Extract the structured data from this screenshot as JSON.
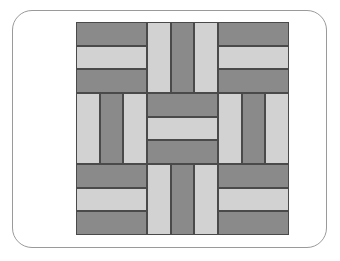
{
  "figure": {
    "background_color": "#ffffff"
  },
  "frame": {
    "name": "rounded-rectangle-border",
    "stroke_color": "#9a9a9a",
    "stroke_width": 1,
    "corner_radius": 20,
    "x": 12,
    "y": 10,
    "width": 315,
    "height": 238
  },
  "palette": {
    "dark_plank": "#8a8a8a",
    "light_plank": "#d2d2d2",
    "plank_outline": "#4a4a4a",
    "canvas": "#ffffff"
  },
  "pattern": {
    "name": "basket-weave",
    "x": 76,
    "y": 22,
    "width": 213,
    "height": 213,
    "grid_rows": 3,
    "grid_cols": 3,
    "block_size": 71,
    "planks_per_block": 3,
    "plank_thickness": 23.67,
    "blocks": [
      {
        "id": "block-r1-c1",
        "row": 1,
        "col": 1,
        "orientation": "horizontal",
        "x": 0,
        "y": 0,
        "size": 71,
        "planks": [
          {
            "index": 1,
            "color": "dark_plank",
            "fill": "#8a8a8a"
          },
          {
            "index": 2,
            "color": "light_plank",
            "fill": "#d2d2d2"
          },
          {
            "index": 3,
            "color": "dark_plank",
            "fill": "#8a8a8a"
          }
        ]
      },
      {
        "id": "block-r1-c2",
        "row": 1,
        "col": 2,
        "orientation": "vertical",
        "x": 71,
        "y": 0,
        "size": 71,
        "planks": [
          {
            "index": 1,
            "color": "light_plank",
            "fill": "#d2d2d2"
          },
          {
            "index": 2,
            "color": "dark_plank",
            "fill": "#8a8a8a"
          },
          {
            "index": 3,
            "color": "light_plank",
            "fill": "#d2d2d2"
          }
        ]
      },
      {
        "id": "block-r1-c3",
        "row": 1,
        "col": 3,
        "orientation": "horizontal",
        "x": 142,
        "y": 0,
        "size": 71,
        "planks": [
          {
            "index": 1,
            "color": "dark_plank",
            "fill": "#8a8a8a"
          },
          {
            "index": 2,
            "color": "light_plank",
            "fill": "#d2d2d2"
          },
          {
            "index": 3,
            "color": "dark_plank",
            "fill": "#8a8a8a"
          }
        ]
      },
      {
        "id": "block-r2-c1",
        "row": 2,
        "col": 1,
        "orientation": "vertical",
        "x": 0,
        "y": 71,
        "size": 71,
        "planks": [
          {
            "index": 1,
            "color": "light_plank",
            "fill": "#d2d2d2"
          },
          {
            "index": 2,
            "color": "dark_plank",
            "fill": "#8a8a8a"
          },
          {
            "index": 3,
            "color": "light_plank",
            "fill": "#d2d2d2"
          }
        ]
      },
      {
        "id": "block-r2-c2",
        "row": 2,
        "col": 2,
        "orientation": "horizontal",
        "x": 71,
        "y": 71,
        "size": 71,
        "planks": [
          {
            "index": 1,
            "color": "dark_plank",
            "fill": "#8a8a8a"
          },
          {
            "index": 2,
            "color": "light_plank",
            "fill": "#d2d2d2"
          },
          {
            "index": 3,
            "color": "dark_plank",
            "fill": "#8a8a8a"
          }
        ]
      },
      {
        "id": "block-r2-c3",
        "row": 2,
        "col": 3,
        "orientation": "vertical",
        "x": 142,
        "y": 71,
        "size": 71,
        "planks": [
          {
            "index": 1,
            "color": "light_plank",
            "fill": "#d2d2d2"
          },
          {
            "index": 2,
            "color": "dark_plank",
            "fill": "#8a8a8a"
          },
          {
            "index": 3,
            "color": "light_plank",
            "fill": "#d2d2d2"
          }
        ]
      },
      {
        "id": "block-r3-c1",
        "row": 3,
        "col": 1,
        "orientation": "horizontal",
        "x": 0,
        "y": 142,
        "size": 71,
        "planks": [
          {
            "index": 1,
            "color": "dark_plank",
            "fill": "#8a8a8a"
          },
          {
            "index": 2,
            "color": "light_plank",
            "fill": "#d2d2d2"
          },
          {
            "index": 3,
            "color": "dark_plank",
            "fill": "#8a8a8a"
          }
        ]
      },
      {
        "id": "block-r3-c2",
        "row": 3,
        "col": 2,
        "orientation": "vertical",
        "x": 71,
        "y": 142,
        "size": 71,
        "planks": [
          {
            "index": 1,
            "color": "light_plank",
            "fill": "#d2d2d2"
          },
          {
            "index": 2,
            "color": "dark_plank",
            "fill": "#8a8a8a"
          },
          {
            "index": 3,
            "color": "light_plank",
            "fill": "#d2d2d2"
          }
        ]
      },
      {
        "id": "block-r3-c3",
        "row": 3,
        "col": 3,
        "orientation": "horizontal",
        "x": 142,
        "y": 142,
        "size": 71,
        "planks": [
          {
            "index": 1,
            "color": "dark_plank",
            "fill": "#8a8a8a"
          },
          {
            "index": 2,
            "color": "light_plank",
            "fill": "#d2d2d2"
          },
          {
            "index": 3,
            "color": "dark_plank",
            "fill": "#8a8a8a"
          }
        ]
      }
    ]
  }
}
